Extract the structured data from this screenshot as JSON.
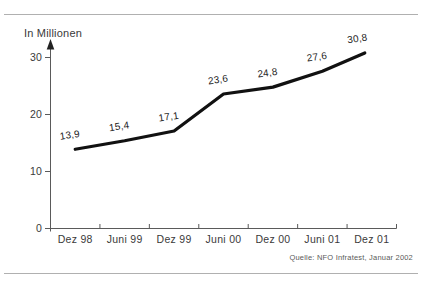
{
  "chart_data": {
    "type": "line",
    "title": "In Millionen",
    "xlabel": "",
    "ylabel": "In Millionen",
    "categories": [
      "Dez 98",
      "Juni 99",
      "Dez 99",
      "Juni 00",
      "Dez 00",
      "Juni 01",
      "Dez 01"
    ],
    "values": [
      13.9,
      15.4,
      17.1,
      23.6,
      24.8,
      27.6,
      30.8
    ],
    "value_labels": [
      "13,9",
      "15,4",
      "17,1",
      "23,6",
      "24,8",
      "27,6",
      "30,8"
    ],
    "yticks": [
      0,
      10,
      20,
      30
    ],
    "ytick_labels": [
      "0",
      "10",
      "20",
      "30"
    ],
    "ylim": [
      0,
      32
    ],
    "grid": false,
    "legend_position": "none",
    "source": "Quelle: NFO Infratest, Januar 2002"
  },
  "colors": {
    "line": "#111111",
    "axis": "#5a5a5a",
    "tick_text": "#3a3a3a",
    "data_label_text": "#1c1c1c",
    "hairline": "#b0b0b0",
    "background": "#ffffff"
  }
}
